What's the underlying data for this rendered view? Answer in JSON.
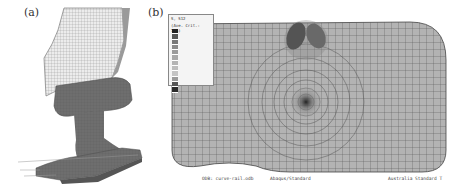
{
  "figure": {
    "panels": [
      {
        "label": "(a)",
        "description": "3D finite element mesh of wheel on rail"
      },
      {
        "label": "(b)",
        "description": "Contact stress contour on rail-head surface mesh"
      }
    ],
    "legend": {
      "header_line1": "S, S12",
      "header_line2": "(Ave. Crit.: 75%)",
      "swatch_colors": [
        "#222222",
        "#555555",
        "#777777",
        "#8a8a8a",
        "#9a9a9a",
        "#a8a8a8",
        "#b4b4b4",
        "#bdbdbd",
        "#c4c4c4",
        "#9a9a9a",
        "#555555",
        "#2a2a2a"
      ]
    },
    "footer": {
      "left": "ODB: curve-rail.odb",
      "middle": "Abaqus/Standard",
      "right": "Australia Standard T"
    },
    "colors": {
      "mesh_fill": "#b3b3b3",
      "mesh_line": "#555555",
      "rail_fill": "#6e6e6e",
      "wheel_fill": "#e6e6e6"
    }
  }
}
